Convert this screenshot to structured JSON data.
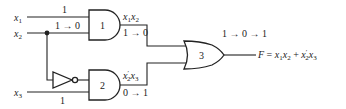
{
  "diagram": {
    "type": "logic-circuit",
    "inputs": [
      {
        "name": "x1",
        "label_base": "x",
        "label_sub": "1",
        "signal": "1"
      },
      {
        "name": "x2",
        "label_base": "x",
        "label_sub": "2",
        "signal": "1 → 0"
      },
      {
        "name": "x3",
        "label_base": "x",
        "label_sub": "3",
        "signal": "1"
      }
    ],
    "gates": [
      {
        "id": "1",
        "type": "AND",
        "label": "1",
        "output_expr": "x1x2",
        "output_transition": "1 → 0"
      },
      {
        "id": "2",
        "type": "AND",
        "label": "2",
        "output_expr": "x2'x3",
        "output_transition": "0 → 1"
      },
      {
        "id": "3",
        "type": "OR",
        "label": "3",
        "output_transition": "1 → 0 → 1"
      },
      {
        "id": "inv",
        "type": "NOT",
        "label": ""
      }
    ],
    "output": {
      "name": "F",
      "equation": "F = x1x2 + x2'x3"
    }
  }
}
